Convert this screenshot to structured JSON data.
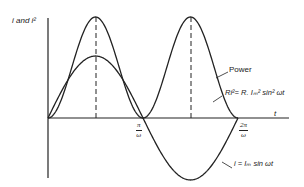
{
  "diagram": {
    "y_axis_label": "i and i²",
    "x_axis_label": "t",
    "ticks": [
      {
        "num": "π",
        "den": "ω"
      },
      {
        "num": "2π",
        "den": "ω"
      }
    ],
    "labels": {
      "power": "Power",
      "power_eq": "Ri²= R. Iₘ² sin² ωt",
      "current_eq": "i = Iₘ sin ωt"
    },
    "colors": {
      "line": "#222222",
      "background": "#ffffff"
    }
  },
  "chart_data": {
    "type": "line",
    "title": "",
    "xlabel": "t",
    "ylabel": "i and i²",
    "x_ticks": [
      "π/ω",
      "2π/ω"
    ],
    "series": [
      {
        "name": "i = Im sin ωt",
        "shape": "sine",
        "amplitude_rel": 0.6,
        "period": "2π/ω"
      },
      {
        "name": "Power Ri² = R Im² sin² ωt",
        "shape": "sin²",
        "amplitude_rel": 1.0,
        "period": "π/ω"
      }
    ],
    "annotations": [
      "dashed vertical lines at π/2ω and 3π/2ω"
    ]
  }
}
